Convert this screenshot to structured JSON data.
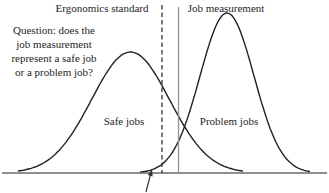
{
  "labels": {
    "ergonomics_standard": "Ergonomics standard",
    "job_measurement": "Job measurement",
    "safe_jobs": "Safe jobs",
    "problem_jobs": "Problem jobs"
  },
  "question": {
    "lines": [
      "Question: does the",
      "job measurement",
      "represent a safe job",
      "or a problem job?"
    ]
  },
  "diagram": {
    "canvas": {
      "width": 329,
      "height": 193,
      "background": "#ffffff"
    },
    "colors": {
      "curve": "#212121",
      "axis": "#212121",
      "standard_line": "#333333",
      "measurement_line": "#949494",
      "arrow": "#333333",
      "text": "#242424"
    },
    "axis": {
      "x1": 2,
      "x2": 327,
      "y": 173
    },
    "curves": [
      {
        "name": "safe-jobs-curve",
        "center_x": 130.5,
        "sigma": 39,
        "peak_y": 52,
        "base_y": 173,
        "x_start": 18,
        "x_end": 243
      },
      {
        "name": "problem-jobs-curve",
        "center_x": 227,
        "sigma": 27,
        "peak_y": 13,
        "base_y": 173,
        "x_start": 140,
        "x_end": 310
      }
    ],
    "vertical_lines": [
      {
        "name": "ergonomics-standard-line",
        "x": 162,
        "y_top": 5,
        "y_bottom": 173,
        "style": "dashed"
      },
      {
        "name": "job-measurement-line",
        "x": 178.5,
        "y_top": 7,
        "y_bottom": 173,
        "style": "solid"
      }
    ],
    "arrow": {
      "tail_x": 146,
      "tail_y": 192,
      "tip_x": 152,
      "tip_y": 169
    }
  }
}
